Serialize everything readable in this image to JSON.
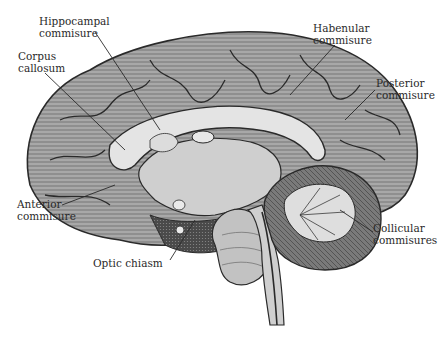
{
  "figure": {
    "style": "grayscale engraving",
    "colors": {
      "background": "#ffffff",
      "cortex": "#9a9a9a",
      "cortex_dark": "#5a5a5a",
      "white_matter": "#d6d6d6",
      "corpus_callosum": "#e2e2e2",
      "cerebellum_light": "#cfcfcf",
      "cerebellum_dark": "#6e6e6e",
      "line": "#2a2a2a",
      "text": "#2a2a2a"
    }
  },
  "labels": [
    {
      "id": "hippocampal",
      "line1": "Hippocampal",
      "line2": "commisure"
    },
    {
      "id": "corpus",
      "line1": "Corpus",
      "line2": "callosum"
    },
    {
      "id": "habenular",
      "line1": "Habenular",
      "line2": "commisure"
    },
    {
      "id": "posterior",
      "line1": "Posterior",
      "line2": "commisure"
    },
    {
      "id": "anterior",
      "line1": "Anterior",
      "line2": "commisure"
    },
    {
      "id": "collicular",
      "line1": "Collicular",
      "line2": "commisures"
    },
    {
      "id": "optic",
      "line1": "Optic chiasm",
      "line2": ""
    }
  ]
}
